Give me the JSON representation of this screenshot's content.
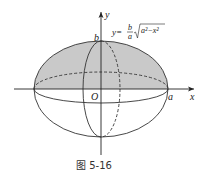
{
  "figure": {
    "caption": "图 5-16",
    "equation": {
      "lhs": "y=",
      "frac_num": "b",
      "frac_den": "a",
      "radicand": "a²−x²"
    },
    "labels": {
      "x_axis": "x",
      "y_axis": "y",
      "origin": "O",
      "a": "a",
      "b": "b"
    },
    "colors": {
      "shade": "#c8c8c8",
      "line": "#333333"
    }
  }
}
